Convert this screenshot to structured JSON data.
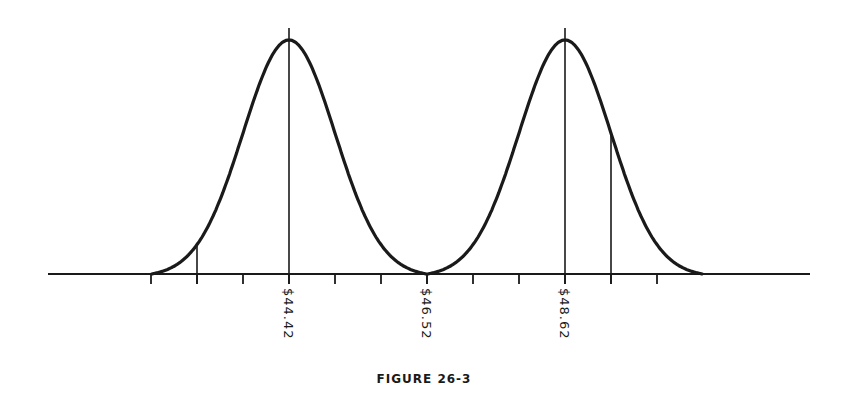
{
  "figure": {
    "caption": "FIGURE 26-3",
    "labels": [
      {
        "text": "$44.42",
        "x": 289
      },
      {
        "text": "$46.52",
        "x": 427
      },
      {
        "text": "$48.62",
        "x": 565
      }
    ]
  },
  "chart_data": {
    "type": "line",
    "title": "FIGURE 26-3",
    "xlabel": "",
    "ylabel": "",
    "grid": false,
    "x_tick_labels": [
      "$44.42",
      "$46.52",
      "$48.62"
    ],
    "x_tick_label_values": [
      44.42,
      46.52,
      48.62
    ],
    "x_tick_spacing": 0.7,
    "x_ticks": [
      42.32,
      43.02,
      43.72,
      44.42,
      45.12,
      45.82,
      46.52,
      47.22,
      47.92,
      48.62,
      49.32,
      50.02
    ],
    "series": [
      {
        "name": "Distribution A",
        "mean": 44.42,
        "sigma": 0.7,
        "range": [
          42.32,
          46.52
        ],
        "marker_lines": [
          43.02,
          44.42,
          46.52
        ]
      },
      {
        "name": "Distribution B",
        "mean": 48.62,
        "sigma": 0.7,
        "range": [
          46.52,
          50.02
        ],
        "marker_lines": [
          46.52,
          48.62,
          49.32
        ]
      }
    ],
    "intersection": 46.52
  }
}
